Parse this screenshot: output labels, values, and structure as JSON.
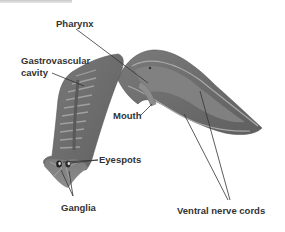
{
  "diagram": {
    "labels": {
      "pharynx": "Pharynx",
      "gastrovascular_line1": "Gastrovascular",
      "gastrovascular_line2": "cavity",
      "mouth": "Mouth",
      "eyespots": "Eyespots",
      "ganglia": "Ganglia",
      "ventral_nerve_cords": "Ventral nerve cords"
    },
    "colors": {
      "body": "#6e6e6e",
      "body_dark": "#595959",
      "body_light": "#8a8a8a",
      "gut_pattern": "#9a9a9a",
      "nerve_cord": "#a8a8a8",
      "leader_line": "#333333",
      "label_text": "#333333",
      "background": "#ffffff"
    }
  }
}
